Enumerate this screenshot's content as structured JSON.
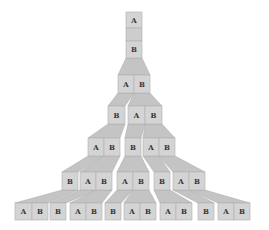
{
  "diagram": {
    "title": "",
    "colors": {
      "cell": "#d4d4d4",
      "trapezoid": "#c4c4c4",
      "label": "#333333",
      "background": "#ffffff"
    },
    "rows": [
      {
        "y": 12,
        "h": 16,
        "cells": [
          {
            "x": 126,
            "w": 16,
            "label": "A"
          }
        ]
      },
      {
        "y": 28,
        "h": 13,
        "cells": [
          {
            "x": 126,
            "w": 16,
            "label": "",
            "blank": true
          }
        ]
      },
      {
        "y": 41,
        "h": 17,
        "cells": [
          {
            "x": 126,
            "w": 16,
            "label": "B"
          }
        ]
      },
      {
        "y": 75,
        "h": 18,
        "cells": [
          {
            "x": 118,
            "w": 16,
            "label": "A"
          },
          {
            "x": 134,
            "w": 16,
            "label": "B"
          }
        ]
      },
      {
        "y": 106,
        "h": 18,
        "cells": [
          {
            "x": 108,
            "w": 17,
            "label": "B"
          },
          {
            "x": 128,
            "w": 17,
            "label": "A"
          },
          {
            "x": 145,
            "w": 17,
            "label": "B"
          }
        ]
      },
      {
        "y": 138,
        "h": 18,
        "cells": [
          {
            "x": 88,
            "w": 16,
            "label": "A"
          },
          {
            "x": 104,
            "w": 16,
            "label": "B"
          },
          {
            "x": 125,
            "w": 16,
            "label": "B"
          },
          {
            "x": 143,
            "w": 16,
            "label": "A"
          },
          {
            "x": 159,
            "w": 16,
            "label": "B"
          }
        ]
      },
      {
        "y": 172,
        "h": 18,
        "cells": [
          {
            "x": 62,
            "w": 16,
            "label": "B"
          },
          {
            "x": 80,
            "w": 16,
            "label": "A"
          },
          {
            "x": 96,
            "w": 16,
            "label": "B"
          },
          {
            "x": 117,
            "w": 16,
            "label": "A"
          },
          {
            "x": 133,
            "w": 16,
            "label": "B"
          },
          {
            "x": 154,
            "w": 16,
            "label": "B"
          },
          {
            "x": 173,
            "w": 16,
            "label": "A"
          },
          {
            "x": 189,
            "w": 16,
            "label": "B"
          }
        ]
      },
      {
        "y": 203,
        "h": 17,
        "cells": [
          {
            "x": 15,
            "w": 17,
            "label": "A"
          },
          {
            "x": 32,
            "w": 16,
            "label": "B"
          },
          {
            "x": 50,
            "w": 16,
            "label": "B"
          },
          {
            "x": 70,
            "w": 16,
            "label": "A"
          },
          {
            "x": 86,
            "w": 16,
            "label": "B"
          },
          {
            "x": 105,
            "w": 16,
            "label": "B"
          },
          {
            "x": 124,
            "w": 16,
            "label": "A"
          },
          {
            "x": 140,
            "w": 16,
            "label": "B"
          },
          {
            "x": 160,
            "w": 16,
            "label": "A"
          },
          {
            "x": 176,
            "w": 16,
            "label": "B"
          },
          {
            "x": 198,
            "w": 16,
            "label": "B"
          },
          {
            "x": 218,
            "w": 16,
            "label": "A"
          },
          {
            "x": 234,
            "w": 16,
            "label": "B"
          }
        ]
      }
    ],
    "expansions": [
      {
        "top_y": 58,
        "bottom_y": 75,
        "top": [
          126,
          142
        ],
        "bottom": [
          118,
          150
        ]
      },
      {
        "top_y": 93,
        "bottom_y": 106,
        "top": [
          118,
          134
        ],
        "bottom": [
          108,
          125
        ]
      },
      {
        "top_y": 93,
        "bottom_y": 106,
        "top": [
          134,
          150
        ],
        "bottom": [
          128,
          162
        ]
      },
      {
        "top_y": 124,
        "bottom_y": 138,
        "top": [
          108,
          125
        ],
        "bottom": [
          88,
          120
        ]
      },
      {
        "top_y": 124,
        "bottom_y": 138,
        "top": [
          128,
          145
        ],
        "bottom": [
          125,
          141
        ]
      },
      {
        "top_y": 124,
        "bottom_y": 138,
        "top": [
          145,
          162
        ],
        "bottom": [
          143,
          175
        ]
      },
      {
        "top_y": 156,
        "bottom_y": 172,
        "top": [
          88,
          104
        ],
        "bottom": [
          62,
          78
        ]
      },
      {
        "top_y": 156,
        "bottom_y": 172,
        "top": [
          104,
          120
        ],
        "bottom": [
          80,
          112
        ]
      },
      {
        "top_y": 156,
        "bottom_y": 172,
        "top": [
          125,
          141
        ],
        "bottom": [
          117,
          149
        ]
      },
      {
        "top_y": 156,
        "bottom_y": 172,
        "top": [
          143,
          159
        ],
        "bottom": [
          154,
          170
        ]
      },
      {
        "top_y": 156,
        "bottom_y": 172,
        "top": [
          159,
          175
        ],
        "bottom": [
          173,
          205
        ]
      },
      {
        "top_y": 190,
        "bottom_y": 203,
        "top": [
          62,
          78
        ],
        "bottom": [
          15,
          48
        ]
      },
      {
        "top_y": 190,
        "bottom_y": 203,
        "top": [
          80,
          96
        ],
        "bottom": [
          50,
          66
        ]
      },
      {
        "top_y": 190,
        "bottom_y": 203,
        "top": [
          96,
          112
        ],
        "bottom": [
          70,
          102
        ]
      },
      {
        "top_y": 190,
        "bottom_y": 203,
        "top": [
          117,
          133
        ],
        "bottom": [
          105,
          121
        ]
      },
      {
        "top_y": 190,
        "bottom_y": 203,
        "top": [
          133,
          149
        ],
        "bottom": [
          124,
          156
        ]
      },
      {
        "top_y": 190,
        "bottom_y": 203,
        "top": [
          154,
          170
        ],
        "bottom": [
          160,
          192
        ]
      },
      {
        "top_y": 190,
        "bottom_y": 203,
        "top": [
          173,
          189
        ],
        "bottom": [
          198,
          214
        ]
      },
      {
        "top_y": 190,
        "bottom_y": 203,
        "top": [
          189,
          205
        ],
        "bottom": [
          218,
          250
        ]
      }
    ]
  }
}
